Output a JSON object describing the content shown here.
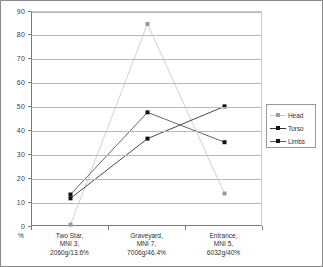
{
  "chart_data": {
    "type": "line",
    "title": "",
    "xlabel": "",
    "ylabel": "%",
    "ylim": [
      0,
      90
    ],
    "ytick_step": 10,
    "grid": true,
    "legend_position": "right",
    "yticks": [
      "0",
      "10",
      "20",
      "30",
      "40",
      "50",
      "60",
      "70",
      "80",
      "90"
    ],
    "categories": [
      "Two Star,\nMNI 3,\n2060g/13.6%",
      "Graveyard,\nMNI 7,\n7006g/46.4%",
      "Entrance,\nMNI 5,\n6032g/40%"
    ],
    "category_lines": [
      [
        "Two Star,",
        "MNI 3,",
        "2060g/13.6%"
      ],
      [
        "Graveyard,",
        "MNI 7,",
        "7006g/46.4%"
      ],
      [
        "Entrance,",
        "MNI 5,",
        "6032g/40%"
      ]
    ],
    "series": [
      {
        "name": "Head",
        "values": [
          1,
          85,
          14
        ],
        "color": "#cccccc",
        "marker": "square"
      },
      {
        "name": "Torso",
        "values": [
          12,
          37,
          50.5
        ],
        "color": "#333333",
        "marker": "square"
      },
      {
        "name": "Limbs",
        "values": [
          13.6,
          48,
          35.5
        ],
        "color": "#555555",
        "marker": "square"
      }
    ]
  },
  "axis": {
    "y_unit_label": "%"
  },
  "legend": {
    "items": [
      {
        "label": "Head"
      },
      {
        "label": "Torso"
      },
      {
        "label": "Limbs"
      }
    ]
  }
}
